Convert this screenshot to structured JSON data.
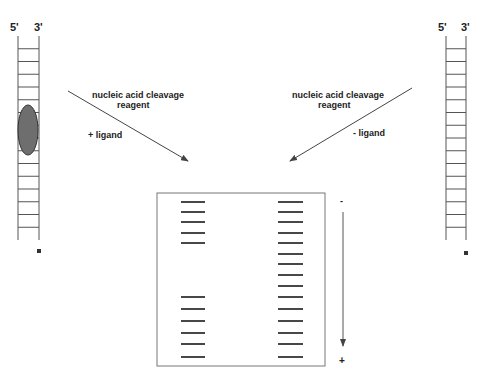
{
  "left_strand": {
    "label_5prime": "5'",
    "label_3prime": "3'",
    "rail_x": [
      18,
      39
    ],
    "top_y": 36,
    "bottom_y": 240,
    "rung_count": 15,
    "bound_ligand": true,
    "end_label_marker": "*"
  },
  "right_strand": {
    "label_5prime": "5'",
    "label_3prime": "3'",
    "rail_x": [
      446,
      466
    ],
    "top_y": 36,
    "bottom_y": 240,
    "rung_count": 15,
    "bound_ligand": false,
    "end_label_marker": "*"
  },
  "left_arrow": {
    "label_line1": "nucleic acid cleavage",
    "label_line2": "reagent",
    "condition": "+ ligand"
  },
  "right_arrow": {
    "label_line1": "nucleic acid cleavage",
    "label_line2": "reagent",
    "condition": "- ligand"
  },
  "gel": {
    "left_lane_bands_y": [
      202,
      212,
      222,
      233,
      243,
      297,
      309,
      321,
      333,
      344,
      357
    ],
    "right_lane_bands_y": [
      202,
      212,
      222,
      233,
      243,
      254,
      264,
      275,
      286,
      297,
      309,
      321,
      333,
      344,
      357
    ],
    "electrophoresis_top_label": "-",
    "electrophoresis_bottom_label": "+"
  },
  "colors": {
    "line": "#555555",
    "band": "#333333",
    "ligand_fill": "#6e6e6e"
  }
}
